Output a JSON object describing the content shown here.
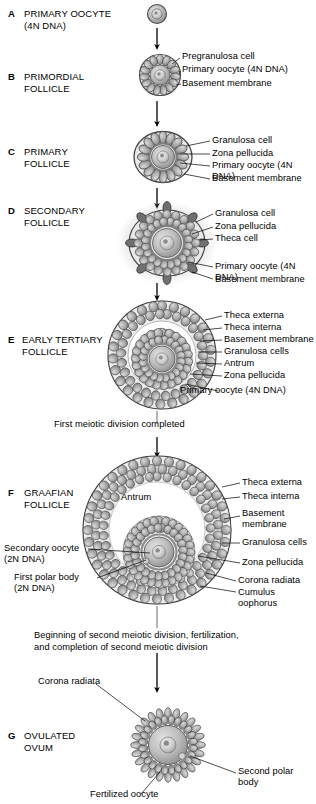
{
  "figure": {
    "stages": [
      {
        "letter": "A",
        "name": "PRIMARY OOCYTE\n(4N DNA)",
        "callouts": []
      },
      {
        "letter": "B",
        "name": "PRIMORDIAL\nFOLLICLE",
        "callouts": [
          "Pregranulosa cell",
          "Primary oocyte (4N DNA)",
          "Basement membrane"
        ]
      },
      {
        "letter": "C",
        "name": "PRIMARY\nFOLLICLE",
        "callouts": [
          "Granulosa cell",
          "Zona pellucida",
          "Primary oocyte (4N DNA)",
          "Basement membrane"
        ]
      },
      {
        "letter": "D",
        "name": "SECONDARY\nFOLLICLE",
        "callouts": [
          "Granulosa cell",
          "Zona pellucida",
          "Theca cell",
          "Primary oocyte (4N DNA)",
          "Basement membrane"
        ]
      },
      {
        "letter": "E",
        "name": "EARLY TERTIARY\nFOLLICLE",
        "callouts": [
          "Theca externa",
          "Theca interna",
          "Basement membrane",
          "Granulosa cells",
          "Antrum",
          "Zona pellucida",
          "Primary oocyte (4N DNA)"
        ]
      },
      {
        "letter": "F",
        "name": "GRAAFIAN\nFOLLICLE",
        "antrum_label": "Antrum",
        "callouts_right": [
          "Theca externa",
          "Theca interna",
          "Basement\nmembrane",
          "Granulosa cells",
          "Zona pellucida",
          "Corona radiata",
          "Cumulus oophorus"
        ],
        "callouts_left": [
          "Secondary oocyte\n(2N DNA)",
          "First polar body\n(2N DNA)"
        ]
      },
      {
        "letter": "G",
        "name": "OVULATED\nOVUM",
        "callouts": [
          "Corona radiata",
          "Second polar body",
          "Fertilized oocyte"
        ]
      }
    ],
    "transitions": [
      "First meiotic division completed",
      "Beginning of second meiotic division, fertilization,\nand completion of second meiotic division"
    ],
    "colors": {
      "ink": "#000000",
      "cell_fill": "#9a9a9a",
      "cell_fill_light": "#c8c8c8",
      "cell_stroke": "#3c3c3c",
      "oocyte_fill": "#b5b5b5",
      "antrum_fill": "#ffffff",
      "theca_dark": "#6e6e6e",
      "halo": "#dcdcdc"
    }
  }
}
